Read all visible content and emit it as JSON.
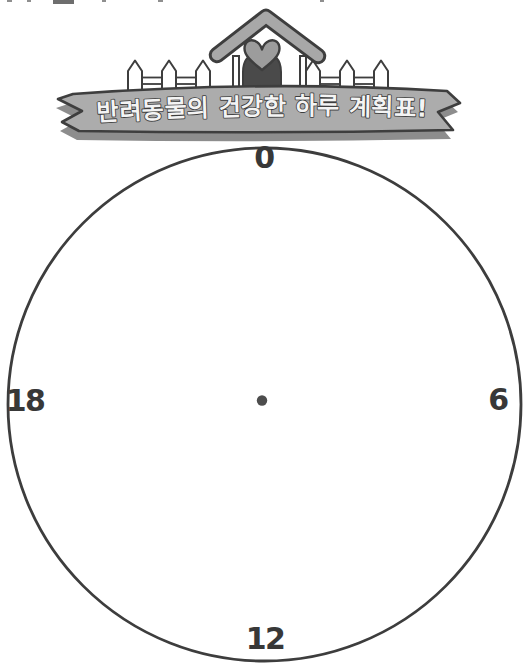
{
  "title_banner": {
    "text": "반려동물의 건강한 하루 계획표!"
  },
  "clock_face": {
    "type": "24-hour-dial",
    "hour_labels": [
      {
        "value": "0",
        "position": "top"
      },
      {
        "value": "6",
        "position": "right"
      },
      {
        "value": "12",
        "position": "bottom"
      },
      {
        "value": "18",
        "position": "left"
      }
    ]
  },
  "colors": {
    "background": "#ffffff",
    "outline": "#3e3e3e",
    "ribbon": "#acacac",
    "ribbon_shadow": "#8d8d8d",
    "banner_text_fill": "#f4f4f4",
    "roof": "#a8a8a8",
    "heart": "#9c9c9c",
    "pet_silhouette": "#4a4a4a",
    "fence": "#ffffff",
    "clock_ring": "#3d3d3d",
    "hour_label": "#383838",
    "center_dot": "#4d4d4d"
  }
}
